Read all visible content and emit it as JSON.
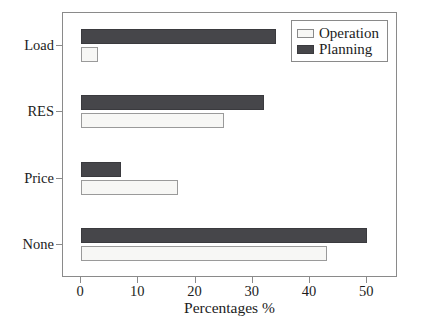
{
  "chart_data": {
    "type": "bar",
    "orientation": "horizontal",
    "title": "",
    "xlabel": "Percentages %",
    "ylabel": "",
    "categories": [
      "Load",
      "RES",
      "Price",
      "None"
    ],
    "series": [
      {
        "name": "Operation",
        "values": [
          3,
          25,
          17,
          43
        ],
        "color": "#f7f7f5",
        "edge_color": "#9a9a9a"
      },
      {
        "name": "Planning",
        "values": [
          34,
          32,
          7,
          50
        ],
        "color": "#46464a",
        "edge_color": "#3a3a3e"
      }
    ],
    "xlim": [
      0,
      55
    ],
    "xticks": [
      0,
      10,
      20,
      30,
      40,
      50
    ],
    "xticklabels": [
      "0",
      "10",
      "20",
      "30",
      "40",
      "50"
    ],
    "grid": false,
    "legend_position": "top-right",
    "frame_color": "#8a8a8a",
    "background": "#ffffff"
  },
  "legend": {
    "entries": [
      {
        "label": "Operation",
        "swatch": "operation-swatch"
      },
      {
        "label": "Planning",
        "swatch": "planning-swatch"
      }
    ]
  }
}
